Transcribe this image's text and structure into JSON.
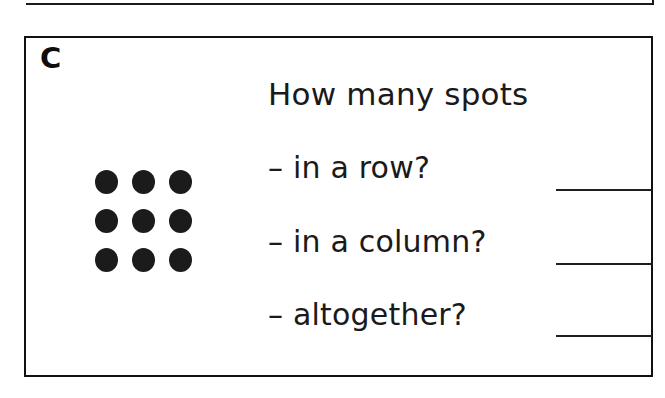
{
  "page": {
    "background_color": "#ffffff",
    "ink_color": "#1a1a1a"
  },
  "previous_exercise": {
    "note": "bottom border of preceding exercise box, cropped at top of image"
  },
  "exercise": {
    "part_letter": "C",
    "heading": "How many spots",
    "border_color": "#111111",
    "questions": [
      {
        "prompt": "– in a row?",
        "answer": ""
      },
      {
        "prompt": "– in a column?",
        "answer": ""
      },
      {
        "prompt": "– altogether?",
        "answer": ""
      }
    ]
  },
  "chart_data": {
    "type": "scatter",
    "rows": 3,
    "columns": 3,
    "total_spots": 9,
    "marker_color": "#1b1b1b",
    "marker_shape": "filled-circle",
    "x": [
      1,
      2,
      3,
      1,
      2,
      3,
      1,
      2,
      3
    ],
    "y": [
      3,
      3,
      3,
      2,
      2,
      2,
      1,
      1,
      1
    ],
    "grid_cells": [
      [
        1,
        1,
        1
      ],
      [
        1,
        1,
        1
      ],
      [
        1,
        1,
        1
      ]
    ],
    "xlabel": "",
    "ylabel": "",
    "grid": false,
    "legend": "none"
  }
}
